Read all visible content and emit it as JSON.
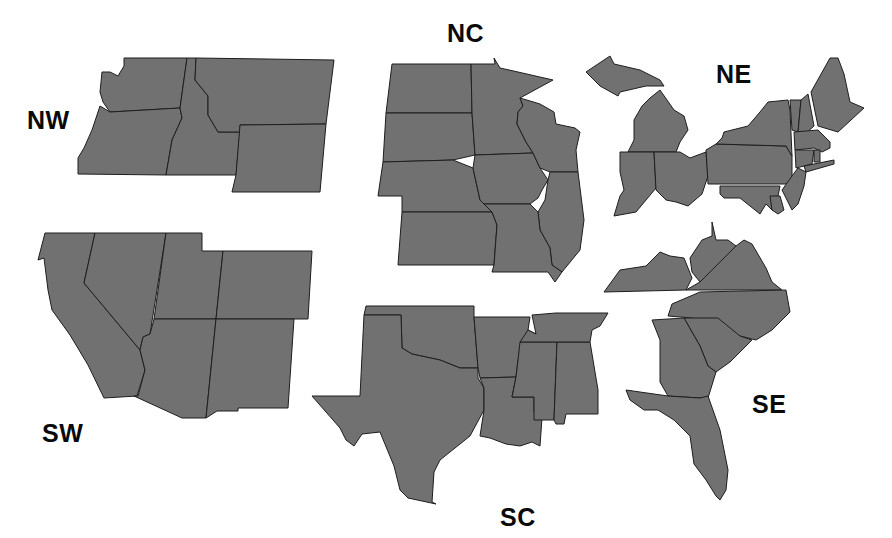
{
  "map": {
    "fill_color": "#717171",
    "border_color": "#1e1e1e",
    "background": "#ffffff"
  },
  "regions": {
    "NW": {
      "label": "NW",
      "label_pos": [
        27,
        108
      ],
      "states": [
        {
          "name": "Washington",
          "points": "124,58 187,58 180,108 110,112 103,102 100,92 102,72 110,72 118,76 124,66"
        },
        {
          "name": "Oregon",
          "points": "100,106 110,112 180,108 182,118 172,140 166,175 78,174 78,158 84,148 92,130"
        },
        {
          "name": "Idaho",
          "points": "187,58 196,58 195,80 208,96 208,115 218,132 240,132 236,175 166,175 172,140 182,118 180,108"
        },
        {
          "name": "Montana",
          "points": "196,58 334,60 326,124 240,125 240,132 218,132 208,115 208,96 195,80"
        },
        {
          "name": "Wyoming",
          "points": "240,125 326,124 320,192 232,192 236,175"
        }
      ]
    },
    "SW": {
      "label": "SW",
      "label_pos": [
        42,
        421
      ],
      "states": [
        {
          "name": "California",
          "points": "45,233 95,233 84,283 140,350 145,370 137,396 104,398 88,365 70,335 52,310 48,290 44,258 38,260"
        },
        {
          "name": "Nevada",
          "points": "95,233 166,233 150,334 143,337 140,350 84,283"
        },
        {
          "name": "Utah",
          "points": "166,233 202,233 202,251 223,251 216,319 154,319"
        },
        {
          "name": "Colorado",
          "points": "223,251 312,251 308,319 216,319"
        },
        {
          "name": "Arizona",
          "points": "154,319 216,319 206,418 182,418 134,396 138,396 145,370 140,350 143,337 150,334"
        },
        {
          "name": "New Mexico",
          "points": "216,319 294,319 288,408 238,408 238,411 217,411 206,418"
        }
      ]
    },
    "NC": {
      "label": "NC",
      "label_pos": [
        447,
        21
      ],
      "states": [
        {
          "name": "North Dakota",
          "points": "392,64 471,64 472,113 386,113"
        },
        {
          "name": "South Dakota",
          "points": "386,113 472,113 475,155 453,160 383,162"
        },
        {
          "name": "Nebraska",
          "points": "383,162 453,160 473,168 480,200 492,212 402,212 402,196 378,196"
        },
        {
          "name": "Kansas",
          "points": "402,212 492,212 497,225 494,265 398,265"
        },
        {
          "name": "Minnesota",
          "points": "471,64 495,64 494,58 500,68 518,72 553,80 520,98 523,106 518,112 517,124 526,142 533,153 475,155 472,113"
        },
        {
          "name": "Iowa",
          "points": "475,155 533,153 540,168 548,180 542,190 538,198 530,204 484,204 480,200 473,168"
        },
        {
          "name": "Wisconsin",
          "points": "520,98 540,104 554,112 556,124 575,128 580,132 576,150 578,172 550,172 540,168 533,153 526,142 517,124 518,112 523,106"
        },
        {
          "name": "Illinois",
          "points": "550,172 578,172 584,220 580,250 562,272 552,265 550,248 540,230 538,212 545,200 548,180"
        },
        {
          "name": "Missouri",
          "points": "484,204 530,204 538,212 540,230 550,248 552,265 562,272 555,282 548,272 492,272 494,265 497,225 492,212"
        }
      ]
    },
    "NE": {
      "label": "NE",
      "label_pos": [
        716,
        62
      ],
      "states": [
        {
          "name": "Michigan Upper",
          "points": "586,72 610,56 614,64 640,70 660,80 664,86 646,86 620,92 618,96 600,86"
        },
        {
          "name": "Michigan Lower",
          "points": "650,98 660,90 674,110 684,116 688,130 680,142 676,152 628,152 634,140 634,120 642,106"
        },
        {
          "name": "Indiana",
          "points": "620,152 654,152 656,188 636,212 614,216 620,196 624,190 620,172"
        },
        {
          "name": "Ohio",
          "points": "654,152 680,152 690,158 706,152 708,176 702,194 688,206 676,202 666,200 656,190"
        },
        {
          "name": "Pennsylvania",
          "points": "706,150 716,144 786,146 792,156 792,180 788,184 708,184"
        },
        {
          "name": "New York",
          "points": "724,132 748,126 760,112 768,102 788,100 790,110 792,156 786,146 716,144 722,138"
        },
        {
          "name": "Vermont",
          "points": "790,100 801,100 798,132 792,130"
        },
        {
          "name": "New Hampshire",
          "points": "801,100 808,94 814,126 805,134 798,132"
        },
        {
          "name": "Maine",
          "points": "811,92 830,58 838,58 844,74 850,102 864,108 838,132 818,126"
        },
        {
          "name": "Massachusetts",
          "points": "794,132 818,130 830,142 830,148 822,152 814,148 795,150"
        },
        {
          "name": "Connecticut",
          "points": "795,150 814,150 812,164 796,168"
        },
        {
          "name": "Rhode Island",
          "points": "814,150 820,150 820,162 814,162"
        },
        {
          "name": "New Jersey",
          "points": "792,176 798,168 806,172 804,186 798,204 792,210 786,198 782,190"
        },
        {
          "name": "Maryland",
          "points": "720,186 780,186 778,196 772,210 766,204 760,214 740,198 724,198 720,194"
        },
        {
          "name": "Delaware",
          "points": "770,196 780,196 784,210 778,214 772,210"
        },
        {
          "name": "Long Island",
          "points": "804,166 834,160 834,164 806,172"
        }
      ]
    },
    "SC": {
      "label": "SC",
      "label_pos": [
        500,
        505
      ],
      "states": [
        {
          "name": "Oklahoma",
          "points": "366,306 474,306 474,317 478,368 460,368 440,360 412,354 402,348 401,315 364,315"
        },
        {
          "name": "Texas",
          "points": "364,315 401,315 402,348 412,354 440,360 460,368 478,368 478,378 484,388 484,410 470,436 440,460 434,472 432,502 436,504 408,498 400,490 394,466 380,432 362,434 354,446 346,440 340,428 312,396 360,396"
        },
        {
          "name": "Arkansas",
          "points": "474,317 530,317 528,330 536,334 518,360 516,377 480,378 478,368"
        },
        {
          "name": "Louisiana",
          "points": "480,378 516,377 512,397 534,397 534,412 542,418 540,446 532,442 520,446 506,444 490,438 480,436 484,410 484,388"
        },
        {
          "name": "Mississippi",
          "points": "520,342 557,342 554,420 534,420 534,397 512,397 516,377 518,360"
        },
        {
          "name": "Alabama",
          "points": "557,342 590,342 598,390 598,414 566,414 564,424 556,424 554,420"
        },
        {
          "name": "Tennessee",
          "points": "532,315 556,313 608,313 600,326 592,330 590,342 520,342 528,330 536,334"
        }
      ]
    },
    "SE": {
      "label": "SE",
      "label_pos": [
        752,
        392
      ],
      "states": [
        {
          "name": "Kentucky",
          "points": "604,292 620,270 646,266 660,252 670,256 684,258 692,278 686,290"
        },
        {
          "name": "West Virginia",
          "points": "692,272 690,258 702,240 712,236 712,222 716,240 728,240 736,246 720,262 706,280 700,282"
        },
        {
          "name": "Virginia",
          "points": "686,290 700,282 720,262 736,246 744,240 752,244 766,268 772,282 782,290"
        },
        {
          "name": "North Carolina",
          "points": "700,292 786,290 790,312 772,330 756,340 740,336 718,332 692,318 668,316 672,304"
        },
        {
          "name": "South Carolina",
          "points": "684,318 718,318 740,336 752,340 730,362 716,372 708,366 700,346"
        },
        {
          "name": "Georgia",
          "points": "652,320 684,318 700,346 708,366 716,372 708,398 700,398 668,396 660,382 660,340"
        },
        {
          "name": "Florida",
          "points": "626,390 668,396 700,398 708,396 720,430 728,470 726,490 720,500 716,496 706,480 694,464 690,436 674,420 658,410 644,410 630,400"
        }
      ]
    }
  },
  "chart_data": {
    "type": "map",
    "title": "",
    "regions": [
      "NW",
      "NC",
      "NE",
      "SW",
      "SC",
      "SE"
    ],
    "region_states": {
      "NW": [
        "Washington",
        "Oregon",
        "Idaho",
        "Montana",
        "Wyoming"
      ],
      "SW": [
        "California",
        "Nevada",
        "Utah",
        "Colorado",
        "Arizona",
        "New Mexico"
      ],
      "NC": [
        "North Dakota",
        "South Dakota",
        "Nebraska",
        "Kansas",
        "Minnesota",
        "Iowa",
        "Wisconsin",
        "Illinois",
        "Missouri"
      ],
      "NE": [
        "Michigan",
        "Indiana",
        "Ohio",
        "Pennsylvania",
        "New York",
        "Vermont",
        "New Hampshire",
        "Maine",
        "Massachusetts",
        "Connecticut",
        "Rhode Island",
        "New Jersey",
        "Maryland",
        "Delaware"
      ],
      "SC": [
        "Oklahoma",
        "Texas",
        "Arkansas",
        "Louisiana",
        "Mississippi",
        "Alabama",
        "Tennessee"
      ],
      "SE": [
        "Kentucky",
        "West Virginia",
        "Virginia",
        "North Carolina",
        "South Carolina",
        "Georgia",
        "Florida"
      ]
    }
  }
}
